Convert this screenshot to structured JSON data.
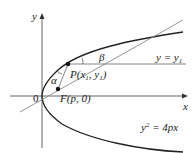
{
  "diagram": {
    "axes": {
      "x_label": "x",
      "y_label": "y",
      "origin_label": "0"
    },
    "point_P": {
      "label_main": "P(x",
      "sub1": "1",
      "mid": ", y",
      "sub2": "1",
      "end": ")"
    },
    "focus": {
      "label": "F(p, 0)"
    },
    "angles": {
      "alpha": "α",
      "beta": "β"
    },
    "horizontal_line": {
      "label_a": "y = y",
      "sub": "1"
    },
    "parabola": {
      "label_a": "y",
      "sup": "2",
      "label_b": " = 4px"
    }
  }
}
